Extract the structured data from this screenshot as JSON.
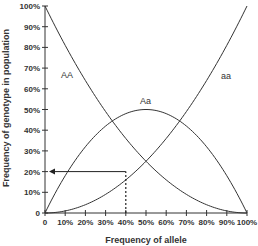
{
  "chart_data": {
    "type": "line",
    "title": "",
    "xlabel": "Frequency of allele",
    "ylabel": "Frequency of genotype in population",
    "xlim": [
      0,
      100
    ],
    "ylim": [
      0,
      100
    ],
    "grid": false,
    "legend": "inline labels",
    "x_ticks": [
      "0",
      "10%",
      "20%",
      "30%",
      "40%",
      "50%",
      "60%",
      "70%",
      "80%",
      "90%",
      "100%"
    ],
    "y_ticks": [
      "0",
      "10%",
      "20%",
      "30%",
      "40%",
      "50%",
      "60%",
      "70%",
      "80%",
      "90%",
      "100%"
    ],
    "x": [
      0,
      10,
      20,
      30,
      40,
      50,
      60,
      70,
      80,
      90,
      100
    ],
    "series": [
      {
        "name": "AA",
        "values": [
          100,
          81,
          64,
          49,
          36,
          25,
          16,
          9,
          4,
          1,
          0
        ]
      },
      {
        "name": "Aa",
        "values": [
          0,
          18,
          32,
          42,
          48,
          50,
          48,
          42,
          32,
          18,
          0
        ]
      },
      {
        "name": "aa",
        "values": [
          0,
          1,
          4,
          9,
          16,
          25,
          36,
          49,
          64,
          81,
          100
        ]
      }
    ],
    "annotations": [
      {
        "type": "dashed-vertical",
        "x": 40,
        "from_y": 0,
        "to_y": 20
      },
      {
        "type": "arrow-horizontal",
        "y": 20,
        "from_x": 40,
        "to_x": 0,
        "direction": "left"
      }
    ]
  },
  "labels": {
    "AA": "AA",
    "Aa": "Aa",
    "aa": "aa",
    "xlabel": "Frequency of allele",
    "ylabel": "Frequency of genotype in population"
  }
}
